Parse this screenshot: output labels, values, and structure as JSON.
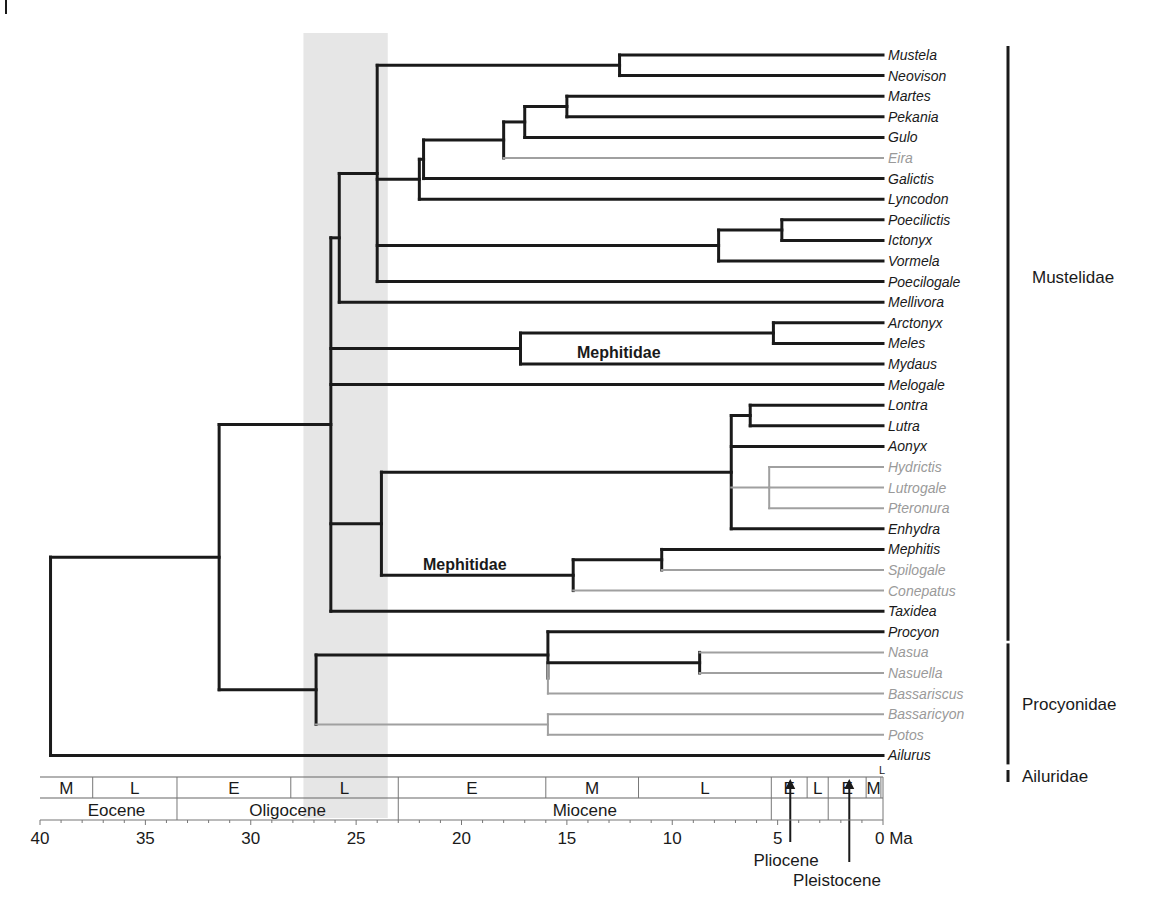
{
  "figure": {
    "type": "time-calibrated phylogeny",
    "x_axis": {
      "unit_label": "Ma",
      "ticks": [
        40,
        35,
        30,
        25,
        20,
        15,
        10,
        5,
        0
      ],
      "tick_labels": [
        "40",
        "35",
        "30",
        "25",
        "20",
        "15",
        "10",
        "5",
        "0 Ma"
      ],
      "range": [
        40,
        0
      ]
    },
    "shaded_band": {
      "from_ma": 27.5,
      "to_ma": 23.5,
      "color": "#e6e6e6"
    },
    "stages_row": [
      {
        "label": "M",
        "from": 40,
        "to": 37.5
      },
      {
        "label": "L",
        "from": 37.5,
        "to": 33.5
      },
      {
        "label": "E",
        "from": 33.5,
        "to": 28.1
      },
      {
        "label": "L",
        "from": 28.1,
        "to": 23
      },
      {
        "label": "E",
        "from": 23,
        "to": 16
      },
      {
        "label": "M",
        "from": 16,
        "to": 11.6
      },
      {
        "label": "L",
        "from": 11.6,
        "to": 5.3
      },
      {
        "label": "E",
        "from": 5.3,
        "to": 3.6
      },
      {
        "label": "L",
        "from": 3.6,
        "to": 2.6
      },
      {
        "label": "E",
        "from": 2.6,
        "to": 0.8
      },
      {
        "label": "M",
        "from": 0.8,
        "to": 0.1
      },
      {
        "label": "L",
        "from": 0.1,
        "to": 0
      }
    ],
    "epochs_row": [
      {
        "label": "Eocene",
        "from": 40,
        "to": 33.5
      },
      {
        "label": "Oligocene",
        "from": 33.5,
        "to": 23
      },
      {
        "label": "Miocene",
        "from": 23,
        "to": 5.3
      },
      {
        "label": "",
        "from": 5.3,
        "to": 2.6
      },
      {
        "label": "",
        "from": 2.6,
        "to": 0
      }
    ],
    "arrow_labels": {
      "pliocene": "Pliocene",
      "pleistocene": "Pleistocene"
    },
    "clade_labels": [
      {
        "text": "Mephitidae",
        "note": "upper label near badger clade"
      },
      {
        "text": "Mephitidae",
        "note": "lower label near skunk clade"
      }
    ],
    "families": [
      {
        "label": "Mustelidae",
        "from_tip": 0,
        "to_tip": 28
      },
      {
        "label": "Procyonidae",
        "from_tip": 29,
        "to_tip": 34
      },
      {
        "label": "Ailuridae",
        "from_tip": 35,
        "to_tip": 35
      }
    ],
    "colors": {
      "branch_dark": "#1a1a1a",
      "branch_grey": "#a0a0a0",
      "band": "#e6e6e6"
    },
    "tips": [
      {
        "name": "Mustela",
        "grey": false
      },
      {
        "name": "Neovison",
        "grey": false
      },
      {
        "name": "Martes",
        "grey": false
      },
      {
        "name": "Pekania",
        "grey": false
      },
      {
        "name": "Gulo",
        "grey": false
      },
      {
        "name": "Eira",
        "grey": true
      },
      {
        "name": "Galictis",
        "grey": false
      },
      {
        "name": "Lyncodon",
        "grey": false
      },
      {
        "name": "Poecilictis",
        "grey": false
      },
      {
        "name": "Ictonyx",
        "grey": false
      },
      {
        "name": "Vormela",
        "grey": false
      },
      {
        "name": "Poecilogale",
        "grey": false
      },
      {
        "name": "Mellivora",
        "grey": false
      },
      {
        "name": "Arctonyx",
        "grey": false
      },
      {
        "name": "Meles",
        "grey": false
      },
      {
        "name": "Mydaus",
        "grey": false
      },
      {
        "name": "Melogale",
        "grey": false
      },
      {
        "name": "Lontra",
        "grey": false
      },
      {
        "name": "Lutra",
        "grey": false
      },
      {
        "name": "Aonyx",
        "grey": false
      },
      {
        "name": "Hydrictis",
        "grey": true
      },
      {
        "name": "Lutrogale",
        "grey": true
      },
      {
        "name": "Pteronura",
        "grey": true
      },
      {
        "name": "Enhydra",
        "grey": false
      },
      {
        "name": "Mephitis",
        "grey": false
      },
      {
        "name": "Spilogale",
        "grey": true
      },
      {
        "name": "Conepatus",
        "grey": true
      },
      {
        "name": "Taxidea",
        "grey": false
      },
      {
        "name": "Procyon",
        "grey": false
      },
      {
        "name": "Nasua",
        "grey": true
      },
      {
        "name": "Nasuella",
        "grey": true
      },
      {
        "name": "Bassariscus",
        "grey": true
      },
      {
        "name": "Bassaricyon",
        "grey": true
      },
      {
        "name": "Potos",
        "grey": true
      },
      {
        "name": "Ailurus",
        "grey": false
      }
    ],
    "tree": {
      "age": 39.5,
      "children": [
        {
          "age": 31.5,
          "children": [
            {
              "age": 26.2,
              "children": [
                {
                  "age": 25.8,
                  "children": [
                    {
                      "age": 24.0,
                      "children": [
                        {
                          "age": 12.5,
                          "children": [
                            {
                              "tip": 0
                            },
                            {
                              "tip": 1
                            }
                          ]
                        },
                        {
                          "age": 22.0,
                          "children": [
                            {
                              "age": 21.8,
                              "children": [
                                {
                                  "age": 18.0,
                                  "children": [
                                    {
                                      "age": 17.0,
                                      "children": [
                                        {
                                          "age": 15.0,
                                          "children": [
                                            {
                                              "tip": 2
                                            },
                                            {
                                              "tip": 3
                                            }
                                          ]
                                        },
                                        {
                                          "tip": 4
                                        }
                                      ]
                                    },
                                    {
                                      "tip": 5,
                                      "grey": true
                                    }
                                  ]
                                },
                                {
                                  "tip": 6
                                }
                              ]
                            },
                            {
                              "tip": 7
                            }
                          ]
                        },
                        {
                          "age": 7.8,
                          "children": [
                            {
                              "age": 4.8,
                              "children": [
                                {
                                  "tip": 8
                                },
                                {
                                  "tip": 9
                                }
                              ]
                            },
                            {
                              "tip": 10
                            }
                          ]
                        },
                        {
                          "tip": 11
                        }
                      ]
                    },
                    {
                      "tip": 12
                    }
                  ]
                },
                {
                  "age": 17.2,
                  "children": [
                    {
                      "age": 5.2,
                      "children": [
                        {
                          "tip": 13
                        },
                        {
                          "tip": 14
                        }
                      ]
                    },
                    {
                      "tip": 15
                    }
                  ]
                },
                {
                  "tip": 16
                },
                {
                  "age": 23.8,
                  "children": [
                    {
                      "age": 7.2,
                      "children": [
                        {
                          "age": 6.3,
                          "children": [
                            {
                              "tip": 17
                            },
                            {
                              "tip": 18
                            }
                          ]
                        },
                        {
                          "tip": 19
                        },
                        {
                          "age": 5.4,
                          "grey": true,
                          "children": [
                            {
                              "tip": 20
                            },
                            {
                              "tip": 21
                            },
                            {
                              "tip": 22
                            }
                          ]
                        },
                        {
                          "tip": 23
                        }
                      ]
                    },
                    {
                      "age": 14.7,
                      "children": [
                        {
                          "age": 10.5,
                          "children": [
                            {
                              "tip": 24
                            },
                            {
                              "tip": 25,
                              "grey": true
                            }
                          ]
                        },
                        {
                          "tip": 26,
                          "grey": true
                        }
                      ]
                    }
                  ]
                },
                {
                  "tip": 27
                }
              ]
            },
            {
              "age": 26.9,
              "children": [
                {
                  "age": 15.9,
                  "children": [
                    {
                      "tip": 28
                    },
                    {
                      "age": 15.9,
                      "grey": true,
                      "children": [
                        {
                          "age": 8.7,
                          "children": [
                            {
                              "tip": 29
                            },
                            {
                              "tip": 30
                            }
                          ]
                        },
                        {
                          "tip": 31
                        }
                      ]
                    }
                  ]
                },
                {
                  "age": 15.9,
                  "grey": true,
                  "children": [
                    {
                      "tip": 32
                    },
                    {
                      "tip": 33
                    }
                  ]
                }
              ]
            }
          ]
        },
        {
          "tip": 34
        }
      ]
    }
  }
}
